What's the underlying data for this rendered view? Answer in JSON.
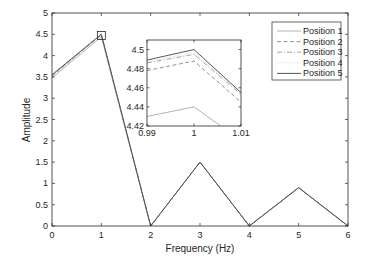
{
  "chart_data": {
    "type": "line",
    "title": "",
    "xlabel": "Frequency (Hz)",
    "ylabel": "Amplitude",
    "xlim": [
      0,
      6
    ],
    "ylim": [
      0,
      5
    ],
    "xticks": [
      "0",
      "1",
      "2",
      "3",
      "4",
      "5",
      "6"
    ],
    "yticks": [
      "0",
      "0.5",
      "1",
      "1.5",
      "2",
      "2.5",
      "3",
      "3.5",
      "4",
      "4.5",
      "5"
    ],
    "grid": false,
    "legend_position": "upper right",
    "x": [
      0,
      1,
      2,
      3,
      4,
      5,
      6
    ],
    "series": [
      {
        "name": "Position 1",
        "style": "solid",
        "color": "#aaaaaa",
        "values": [
          3.48,
          4.44,
          0,
          1.5,
          0,
          0.9,
          0
        ]
      },
      {
        "name": "Position 2",
        "style": "dashed",
        "color": "#888888",
        "values": [
          3.52,
          4.488,
          0,
          1.5,
          0,
          0.9,
          0
        ]
      },
      {
        "name": "Position 3",
        "style": "dashdot",
        "color": "#999999",
        "values": [
          3.53,
          4.495,
          0,
          1.5,
          0,
          0.9,
          0
        ]
      },
      {
        "name": "Position 4",
        "style": "dotted",
        "color": "#cccccc",
        "values": [
          3.54,
          4.497,
          0,
          1.5,
          0,
          0.9,
          0
        ]
      },
      {
        "name": "Position 5",
        "style": "solid",
        "color": "#444444",
        "values": [
          3.55,
          4.5,
          0,
          1.5,
          0,
          0.9,
          0
        ]
      }
    ],
    "inset": {
      "xlim": [
        0.99,
        1.01
      ],
      "ylim": [
        4.42,
        4.51
      ],
      "xticks": [
        "0.99",
        "1",
        "1.01"
      ],
      "yticks": [
        "4.42",
        "4.44",
        "4.46",
        "4.48",
        "4.5"
      ],
      "x": [
        0.99,
        1,
        1.01
      ],
      "series": [
        {
          "name": "Position 1",
          "values": [
            4.43,
            4.44,
            4.405
          ]
        },
        {
          "name": "Position 2",
          "values": [
            4.478,
            4.488,
            4.445
          ]
        },
        {
          "name": "Position 3",
          "values": [
            4.486,
            4.495,
            4.453
          ]
        },
        {
          "name": "Position 4",
          "values": [
            4.487,
            4.497,
            4.454
          ]
        },
        {
          "name": "Position 5",
          "values": [
            4.489,
            4.5,
            4.455
          ]
        }
      ],
      "zoom_marker": {
        "x": 1,
        "y": 4.47
      }
    }
  }
}
